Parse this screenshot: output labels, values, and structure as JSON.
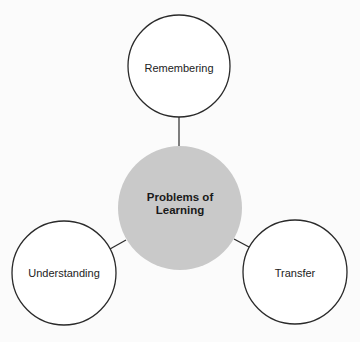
{
  "diagram": {
    "type": "hub-and-spoke",
    "center": {
      "label": "Problems of Learning",
      "fill": "#c9c9c9",
      "cx": 180,
      "cy": 208,
      "r": 62
    },
    "nodes": [
      {
        "label": "Remembering",
        "cx": 179,
        "cy": 66,
        "r": 51,
        "fill": "#ffffff"
      },
      {
        "label": "Understanding",
        "cx": 64,
        "cy": 273,
        "r": 52,
        "fill": "#ffffff"
      },
      {
        "label": "Transfer",
        "cx": 295,
        "cy": 272,
        "r": 52,
        "fill": "#ffffff"
      }
    ],
    "connectors": [
      {
        "from": "Problems of Learning",
        "to": "Remembering"
      },
      {
        "from": "Problems of Learning",
        "to": "Understanding"
      },
      {
        "from": "Problems of Learning",
        "to": "Transfer"
      }
    ],
    "stroke": "#2a2a2a",
    "background": "#fbfbfb"
  }
}
